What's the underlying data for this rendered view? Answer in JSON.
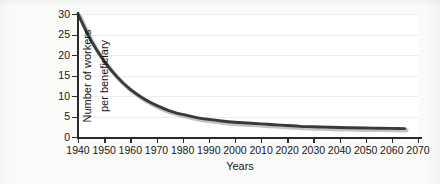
{
  "chart_data": {
    "type": "line",
    "title": "",
    "xlabel": "Years",
    "ylabel": "Number of workers per beneficiary",
    "ylabel_lines": [
      "Number of workers",
      "per beneficiary"
    ],
    "xlim": [
      1940,
      2070
    ],
    "ylim": [
      0,
      30
    ],
    "xticks": [
      1940,
      1950,
      1960,
      1970,
      1980,
      1990,
      2000,
      2010,
      2020,
      2030,
      2040,
      2050,
      2060,
      2070
    ],
    "xtick_labels": [
      "1940",
      "1950",
      "1960",
      "1970",
      "1980",
      "1990",
      "2000",
      "2010",
      "2020",
      "2030",
      "2040",
      "2050",
      "2060",
      "2070"
    ],
    "yticks": [
      0,
      5,
      10,
      15,
      20,
      25,
      30
    ],
    "ytick_labels": [
      "0",
      "5",
      "10",
      "15",
      "20",
      "25",
      "30"
    ],
    "grid": "horizontal",
    "legend": "none",
    "series": [
      {
        "name": "Workers per beneficiary",
        "color": "#3a3a3a",
        "x": [
          1940,
          1945,
          1950,
          1955,
          1960,
          1965,
          1970,
          1975,
          1980,
          1985,
          1990,
          1995,
          2000,
          2005,
          2010,
          2015,
          2020,
          2025,
          2030,
          2035,
          2040,
          2045,
          2050,
          2055,
          2060,
          2065
        ],
        "values": [
          30.0,
          23.5,
          18.5,
          14.6,
          11.6,
          9.4,
          7.7,
          6.4,
          5.5,
          4.8,
          4.3,
          3.9,
          3.6,
          3.4,
          3.2,
          3.0,
          2.8,
          2.6,
          2.5,
          2.4,
          2.3,
          2.25,
          2.2,
          2.15,
          2.1,
          2.05
        ]
      }
    ]
  },
  "axis": {
    "x_title": "Years"
  }
}
